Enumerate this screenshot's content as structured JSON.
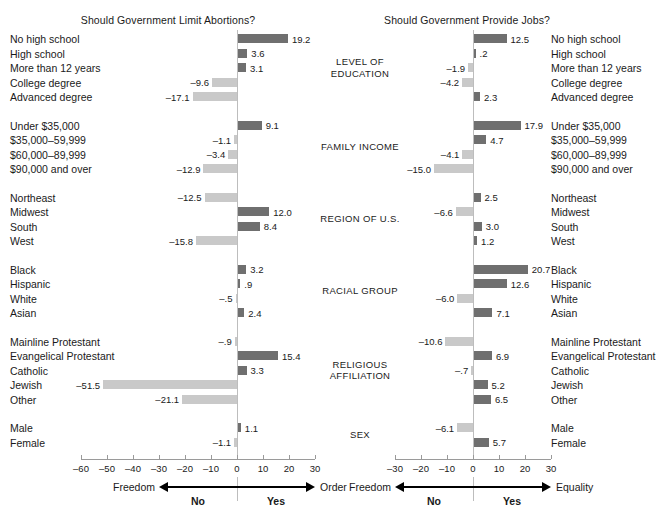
{
  "chart_data": [
    {
      "type": "bar",
      "title": "Should Government Limit Abortions?",
      "orientation": "horizontal",
      "xlabel": "",
      "ylabel": "",
      "xlim": [
        -60,
        30
      ],
      "xticks": [
        -60,
        -50,
        -40,
        -30,
        -20,
        -10,
        0,
        10,
        20,
        30
      ],
      "xticklabels": [
        "–60",
        "–50",
        "–40",
        "–30",
        "–20",
        "–10",
        "0",
        "10",
        "20",
        "30"
      ],
      "grid": false,
      "legend": "none",
      "axis_left_label": "Freedom",
      "axis_right_label": "Order",
      "axis_left_sublabel": "No",
      "axis_right_sublabel": "Yes",
      "groups": [
        {
          "name": "LEVEL OF\nEDUCATION",
          "categories": [
            "No high school",
            "High school",
            "More than 12 years",
            "College degree",
            "Advanced degree"
          ],
          "values": [
            19.2,
            3.6,
            3.1,
            -9.6,
            -17.1
          ],
          "labels": [
            "19.2",
            "3.6",
            "3.1",
            "–9.6",
            "–17.1"
          ]
        },
        {
          "name": "FAMILY INCOME",
          "categories": [
            "Under $35,000",
            "$35,000–59,999",
            "$60,000–89,999",
            "$90,000 and over"
          ],
          "values": [
            9.1,
            -1.1,
            -3.4,
            -12.9
          ],
          "labels": [
            "9.1",
            "–1.1",
            "–3.4",
            "–12.9"
          ]
        },
        {
          "name": "REGION OF U.S.",
          "categories": [
            "Northeast",
            "Midwest",
            "South",
            "West"
          ],
          "values": [
            -12.5,
            12.0,
            8.4,
            -15.8
          ],
          "labels": [
            "–12.5",
            "12.0",
            "8.4",
            "–15.8"
          ]
        },
        {
          "name": "RACIAL GROUP",
          "categories": [
            "Black",
            "Hispanic",
            "White",
            "Asian"
          ],
          "values": [
            3.2,
            0.9,
            -0.5,
            2.4
          ],
          "labels": [
            "3.2",
            ".9",
            "–.5",
            "2.4"
          ]
        },
        {
          "name": "RELIGIOUS\nAFFILIATION",
          "categories": [
            "Mainline Protestant",
            "Evangelical Protestant",
            "Catholic",
            "Jewish",
            "Other"
          ],
          "values": [
            -0.9,
            15.4,
            3.3,
            -51.5,
            -21.1
          ],
          "labels": [
            "–.9",
            "15.4",
            "3.3",
            "–51.5",
            "–21.1"
          ]
        },
        {
          "name": "SEX",
          "categories": [
            "Male",
            "Female"
          ],
          "values": [
            1.1,
            -1.1
          ],
          "labels": [
            "1.1",
            "–1.1"
          ]
        }
      ]
    },
    {
      "type": "bar",
      "title": "Should Government Provide Jobs?",
      "orientation": "horizontal",
      "xlabel": "",
      "ylabel": "",
      "xlim": [
        -30,
        30
      ],
      "xticks": [
        -30,
        -20,
        -10,
        0,
        10,
        20,
        30
      ],
      "xticklabels": [
        "–30",
        "–20",
        "–10",
        "0",
        "10",
        "20",
        "30"
      ],
      "grid": false,
      "legend": "none",
      "axis_left_label": "Freedom",
      "axis_right_label": "Equality",
      "axis_left_sublabel": "No",
      "axis_right_sublabel": "Yes",
      "groups": [
        {
          "name": "LEVEL OF\nEDUCATION",
          "categories": [
            "No high school",
            "High school",
            "More than 12 years",
            "College degree",
            "Advanced degree"
          ],
          "values": [
            12.5,
            0.2,
            -1.9,
            -4.2,
            2.3
          ],
          "labels": [
            "12.5",
            ".2",
            "–1.9",
            "–4.2",
            "2.3"
          ]
        },
        {
          "name": "FAMILY INCOME",
          "categories": [
            "Under $35,000",
            "$35,000–59,999",
            "$60,000–89,999",
            "$90,000 and over"
          ],
          "values": [
            17.9,
            4.7,
            -4.1,
            -15.0
          ],
          "labels": [
            "17.9",
            "4.7",
            "–4.1",
            "–15.0"
          ]
        },
        {
          "name": "REGION OF U.S.",
          "categories": [
            "Northeast",
            "Midwest",
            "South",
            "West"
          ],
          "values": [
            2.5,
            -6.6,
            3.0,
            1.2
          ],
          "labels": [
            "2.5",
            "–6.6",
            "3.0",
            "1.2"
          ]
        },
        {
          "name": "RACIAL GROUP",
          "categories": [
            "Black",
            "Hispanic",
            "White",
            "Asian"
          ],
          "values": [
            20.7,
            12.6,
            -6.0,
            7.1
          ],
          "labels": [
            "20.7",
            "12.6",
            "–6.0",
            "7.1"
          ]
        },
        {
          "name": "RELIGIOUS\nAFFILIATION",
          "categories": [
            "Mainline Protestant",
            "Evangelical Protestant",
            "Catholic",
            "Jewish",
            "Other"
          ],
          "values": [
            -10.6,
            6.9,
            -0.7,
            5.2,
            6.5
          ],
          "labels": [
            "–10.6",
            "6.9",
            "–.7",
            "5.2",
            "6.5"
          ]
        },
        {
          "name": "SEX",
          "categories": [
            "Male",
            "Female"
          ],
          "values": [
            -6.1,
            5.7
          ],
          "labels": [
            "–6.1",
            "5.7"
          ]
        }
      ]
    }
  ],
  "style": {
    "positive_bar_color": "#6f6f6f",
    "negative_bar_color": "#c9c9c9",
    "axis_color": "#9a9a9a",
    "text_color": "#1a1a1a",
    "background": "#ffffff"
  },
  "layout": {
    "group_label_column": "center",
    "left_panel_zero_px": 237,
    "right_panel_zero_px": 137,
    "px_per_unit": 2.6,
    "row_height_px": 14.5
  }
}
